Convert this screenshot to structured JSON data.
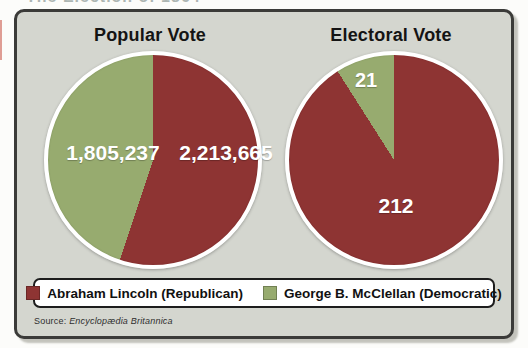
{
  "page": {
    "clipped_heading": "The Election of 1864",
    "source_prefix": "Source:",
    "source_name": "Encyclopædia Britannica"
  },
  "colors": {
    "lincoln_red": "#8e3433",
    "mcclellan_green": "#97ab6f",
    "panel_background": "#d4d6cf",
    "panel_border": "#3b3b39",
    "legend_background": "#ffffff",
    "label_text": "#ffffff"
  },
  "chart_data": [
    {
      "type": "pie",
      "title": "Popular Vote",
      "start_angle_deg": 0,
      "direction": "clockwise",
      "slices": [
        {
          "label": "Abraham Lincoln (Republican)",
          "value": 2213665,
          "display": "2,213,665",
          "color": "#8e3433"
        },
        {
          "label": "George B. McClellan (Democratic)",
          "value": 1805237,
          "display": "1,805,237",
          "color": "#97ab6f"
        }
      ]
    },
    {
      "type": "pie",
      "title": "Electoral Vote",
      "start_angle_deg": 0,
      "direction": "clockwise",
      "slices": [
        {
          "label": "Abraham Lincoln (Republican)",
          "value": 212,
          "display": "212",
          "color": "#8e3433"
        },
        {
          "label": "George B. McClellan (Democratic)",
          "value": 21,
          "display": "21",
          "color": "#97ab6f"
        }
      ]
    }
  ],
  "legend": {
    "items": [
      {
        "label": "Abraham Lincoln (Republican)",
        "color": "#8e3433"
      },
      {
        "label": "George B. McClellan (Democratic)",
        "color": "#97ab6f"
      }
    ]
  }
}
